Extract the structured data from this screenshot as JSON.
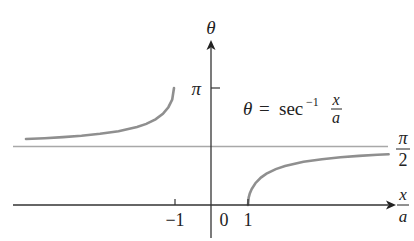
{
  "chart_data": {
    "type": "line",
    "title": "",
    "equation": {
      "lhs": "θ",
      "eq": "=",
      "func": "sec",
      "sup": "−1",
      "frac_num": "x",
      "frac_den": "a"
    },
    "xlabel": {
      "num": "x",
      "den": "a"
    },
    "ylabel": "θ",
    "x_ticks": [
      {
        "value": -1,
        "label": "−1"
      },
      {
        "value": 0,
        "label": "0"
      },
      {
        "value": 1,
        "label": "1"
      }
    ],
    "y_ticks": [
      {
        "value": 3.14159,
        "label": "π"
      }
    ],
    "asymptote": {
      "value": 1.5708,
      "label_num": "π",
      "label_den": "2"
    },
    "xlim": [
      -5.4,
      4.8
    ],
    "ylim": [
      -0.9,
      4.7
    ],
    "grid": false,
    "legend": "none",
    "series": [
      {
        "name": "left-branch",
        "domain": [
          -5.0,
          -1.0
        ],
        "x": [
          -5.0,
          -4.5,
          -4.0,
          -3.5,
          -3.0,
          -2.5,
          -2.0,
          -1.75,
          -1.5,
          -1.3,
          -1.15,
          -1.05,
          -1.0
        ],
        "y": [
          1.772,
          1.794,
          1.823,
          1.862,
          1.911,
          1.982,
          2.094,
          2.178,
          2.301,
          2.447,
          2.627,
          2.831,
          3.142
        ]
      },
      {
        "name": "right-branch",
        "domain": [
          1.0,
          4.8
        ],
        "x": [
          1.0,
          1.02,
          1.05,
          1.1,
          1.2,
          1.35,
          1.5,
          1.75,
          2.0,
          2.5,
          3.0,
          3.5,
          4.0,
          4.5,
          4.8
        ],
        "y": [
          0.0,
          0.199,
          0.309,
          0.43,
          0.586,
          0.737,
          0.841,
          0.963,
          1.047,
          1.159,
          1.231,
          1.281,
          1.318,
          1.347,
          1.361
        ]
      }
    ],
    "colors": {
      "axis": "#333333",
      "curve": "#8f8f8f",
      "asymptote": "#a8a8a8",
      "text": "#222222"
    }
  }
}
